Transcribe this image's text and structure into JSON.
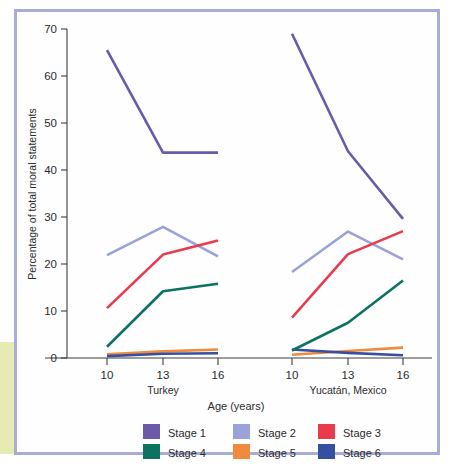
{
  "chart_data": {
    "type": "line",
    "title": "",
    "xlabel": "Age (years)",
    "ylabel": "Percentage of total moral statements",
    "ylim": [
      0,
      70
    ],
    "ytick_labels": [
      "0",
      "10",
      "20",
      "30",
      "40",
      "50",
      "60",
      "70"
    ],
    "yticks": [
      0,
      10,
      20,
      30,
      40,
      50,
      60,
      70
    ],
    "grid": false,
    "legend_position": "bottom",
    "categories": [
      "10",
      "13",
      "16"
    ],
    "groups": [
      {
        "name": "Turkey",
        "x": [
          "10",
          "13",
          "16"
        ],
        "series": [
          {
            "name": "Stage 1",
            "values": [
              65.5,
              43.7,
              43.7
            ]
          },
          {
            "name": "Stage 2",
            "values": [
              21.9,
              27.9,
              21.6
            ]
          },
          {
            "name": "Stage 3",
            "values": [
              10.6,
              22.0,
              25.0
            ]
          },
          {
            "name": "Stage 4",
            "values": [
              2.4,
              14.2,
              15.8
            ]
          },
          {
            "name": "Stage 5",
            "values": [
              0.8,
              1.4,
              1.8
            ]
          },
          {
            "name": "Stage 6",
            "values": [
              0.4,
              0.9,
              1.0
            ]
          }
        ]
      },
      {
        "name": "Yucatán, Mexico",
        "x": [
          "10",
          "13",
          "16"
        ],
        "series": [
          {
            "name": "Stage 1",
            "values": [
              69.0,
              44.0,
              29.6
            ]
          },
          {
            "name": "Stage 2",
            "values": [
              18.3,
              26.9,
              21.0
            ]
          },
          {
            "name": "Stage 3",
            "values": [
              8.6,
              22.1,
              27.0
            ]
          },
          {
            "name": "Stage 4",
            "values": [
              1.6,
              7.5,
              16.5
            ]
          },
          {
            "name": "Stage 5",
            "values": [
              0.7,
              1.5,
              2.2
            ]
          },
          {
            "name": "Stage 6",
            "values": [
              1.8,
              1.1,
              0.6
            ]
          }
        ]
      }
    ],
    "legend": [
      {
        "label": "Stage 1",
        "color": "#6a5aa8"
      },
      {
        "label": "Stage 2",
        "color": "#9aa2d8"
      },
      {
        "label": "Stage 3",
        "color": "#ea3b4d"
      },
      {
        "label": "Stage 4",
        "color": "#0d7260"
      },
      {
        "label": "Stage 5",
        "color": "#f08a3c"
      },
      {
        "label": "Stage 6",
        "color": "#3550a0"
      }
    ],
    "colors": {
      "stage_1": "#6a5aa8",
      "stage_2": "#9aa2d8",
      "stage_3": "#ea3b4d",
      "stage_4": "#0d7260",
      "stage_5": "#f08a3c",
      "stage_6": "#3550a0",
      "frame_border": "#a8add8",
      "axis": "#3c3c3c",
      "edge_strip": "#dde39a"
    }
  },
  "axes": {
    "y_title": "Percentage of total moral statements",
    "x_title": "Age (years)",
    "y_ticks": [
      "70",
      "60",
      "50",
      "40",
      "30",
      "20",
      "10",
      "0"
    ],
    "x_ticks_group_1": [
      "10",
      "13",
      "16"
    ],
    "x_ticks_group_2": [
      "10",
      "13",
      "16"
    ],
    "group_1_label": "Turkey",
    "group_2_label": "Yucatán, Mexico"
  },
  "legend": {
    "items": [
      {
        "label": "Stage 1"
      },
      {
        "label": "Stage 2"
      },
      {
        "label": "Stage 3"
      },
      {
        "label": "Stage 4"
      },
      {
        "label": "Stage 5"
      },
      {
        "label": "Stage 6"
      }
    ]
  }
}
